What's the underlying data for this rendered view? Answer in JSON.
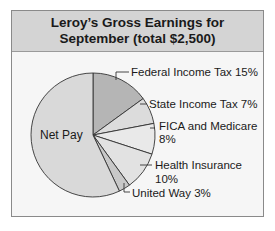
{
  "chart_data": {
    "type": "pie",
    "title_lines": [
      "Leroy’s Gross Earnings for",
      "September (total $2,500)"
    ],
    "total": 2500,
    "slices": [
      {
        "label": "Federal Income Tax",
        "value": 15,
        "display": "Federal Income Tax 15%",
        "color": "#b5b5b5"
      },
      {
        "label": "State Income Tax",
        "value": 7,
        "display": "State Income Tax 7%",
        "color": "#dcdcdc"
      },
      {
        "label": "FICA and Medicare",
        "value": 8,
        "display": "FICA and Medicare 8%",
        "color": "#e9e9e9"
      },
      {
        "label": "Health Insurance",
        "value": 10,
        "display": "Health Insurance 10%",
        "color": "#e2e2e2"
      },
      {
        "label": "United Way",
        "value": 3,
        "display": "United Way 3%",
        "color": "#c8c8c8"
      },
      {
        "label": "Net Pay",
        "value": 57,
        "display": "Net Pay",
        "color": "#d9d9d9"
      }
    ],
    "legend": "none (leader-line labels)"
  },
  "labels": {
    "federal": "Federal Income Tax 15%",
    "state": "State Income Tax 7%",
    "fica_1": "FICA and Medicare",
    "fica_2": "8%",
    "health_1": "Health Insurance",
    "health_2": "10%",
    "united": "United Way 3%",
    "net": "Net Pay"
  }
}
